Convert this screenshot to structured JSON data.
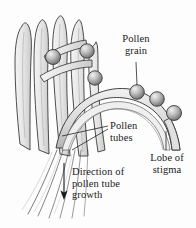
{
  "figure": {
    "background_color": "#fdfdfd",
    "ink_color": "#1a1a1a",
    "tissue_fill": "#e8e8e8",
    "grain_fill": "#b4b4b4"
  },
  "labels": {
    "pollen_grain": "Pollen\ngrain",
    "pollen_tubes": "Pollen\ntubes",
    "lobe_of_stigma": "Lobe of\nstigma",
    "direction_of_growth": "Direction of\npollen tube\ngrowth"
  },
  "diagram_elements": {
    "papillae_count": 5,
    "pollen_grains_on_papillae": 3,
    "pollen_grains_on_stigma_lobe": 3,
    "arrow_direction": "down",
    "leader_lines": 5
  }
}
